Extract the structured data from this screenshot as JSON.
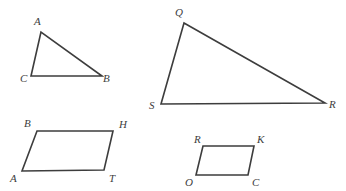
{
  "figure": {
    "background_color": "#ffffff",
    "stroke_color": "#3d3d3d",
    "label_color": "#3d3d3d",
    "stroke_width": 1.6,
    "width": 346,
    "height": 191,
    "shapes": [
      {
        "id": "triangle-acb",
        "kind": "triangle",
        "points": "41,32 31,76 102,76",
        "vertices": [
          {
            "label": "A",
            "x": 41,
            "y": 32,
            "label_x": 34,
            "label_y": 16
          },
          {
            "label": "C",
            "x": 31,
            "y": 76,
            "label_x": 20,
            "label_y": 73
          },
          {
            "label": "B",
            "x": 102,
            "y": 76,
            "label_x": 103,
            "label_y": 73
          }
        ]
      },
      {
        "id": "triangle-qsr",
        "kind": "triangle",
        "points": "184,23 161,104 325,103",
        "vertices": [
          {
            "label": "Q",
            "x": 184,
            "y": 23,
            "label_x": 175,
            "label_y": 7
          },
          {
            "label": "S",
            "x": 161,
            "y": 104,
            "label_x": 149,
            "label_y": 100
          },
          {
            "label": "R",
            "x": 325,
            "y": 103,
            "label_x": 329,
            "label_y": 99
          }
        ]
      },
      {
        "id": "parallelogram-bhta",
        "kind": "parallelogram",
        "points": "37,131 113,131 104,170 22,171",
        "vertices": [
          {
            "label": "B",
            "x": 37,
            "y": 131,
            "label_x": 24,
            "label_y": 118
          },
          {
            "label": "H",
            "x": 113,
            "y": 131,
            "label_x": 119,
            "label_y": 119
          },
          {
            "label": "T",
            "x": 104,
            "y": 170,
            "label_x": 109,
            "label_y": 173
          },
          {
            "label": "A",
            "x": 22,
            "y": 171,
            "label_x": 10,
            "label_y": 173
          }
        ]
      },
      {
        "id": "parallelogram-rkco",
        "kind": "parallelogram",
        "points": "203,146 254,146 248,175 196,175",
        "vertices": [
          {
            "label": "R",
            "x": 203,
            "y": 146,
            "label_x": 194,
            "label_y": 134
          },
          {
            "label": "K",
            "x": 254,
            "y": 146,
            "label_x": 257,
            "label_y": 134
          },
          {
            "label": "C",
            "x": 248,
            "y": 175,
            "label_x": 252,
            "label_y": 177
          },
          {
            "label": "O",
            "x": 196,
            "y": 175,
            "label_x": 185,
            "label_y": 177
          }
        ]
      }
    ]
  }
}
